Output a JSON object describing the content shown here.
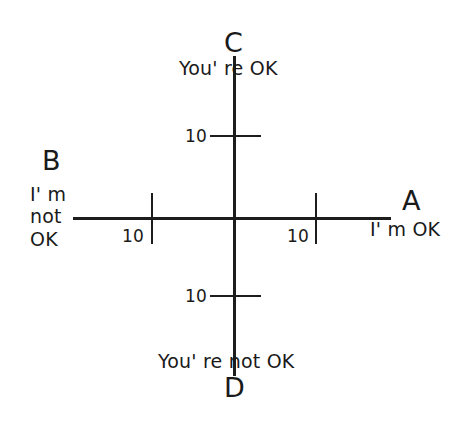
{
  "diagram": {
    "background_color": "#ffffff",
    "line_color": "#1d1d1d",
    "axes": {
      "vertical": {
        "label": "You're OK / You're not OK"
      },
      "horizontal": {
        "label": "I'm OK / I'm not OK"
      }
    },
    "quadrant_labels": {
      "top": "C",
      "left": "B",
      "right": "A",
      "bottom": "D"
    },
    "axis_text": {
      "top": "You' re OK",
      "left_line1": "I' m",
      "left_line2": "not",
      "left_line3": "OK",
      "right": "I' m OK",
      "bottom": "You' re not OK"
    },
    "scale_values": {
      "left": "10",
      "right": "10",
      "top": "10",
      "bottom": "10"
    }
  }
}
